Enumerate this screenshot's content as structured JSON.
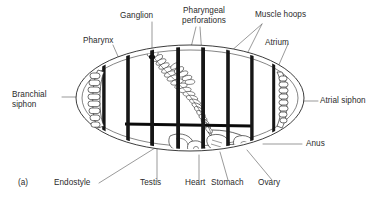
{
  "figure": {
    "panel_mark": "(a)",
    "background_color": "#ffffff",
    "ink_color": "#1a1a1a",
    "leader_color": "#6b6b6b"
  },
  "labels": {
    "pharynx": "Pharynx",
    "ganglion": "Ganglion",
    "pharyngeal_perforations": "Pharyngeal\nperforations",
    "muscle_hoops": "Muscle hoops",
    "atrium": "Atrium",
    "branchial_siphon": "Branchial\nsiphon",
    "atrial_siphon": "Atrial siphon",
    "anus": "Anus",
    "endostyle": "Endostyle",
    "testis": "Testis",
    "heart": "Heart",
    "stomach": "Stomach",
    "ovary": "Ovary"
  },
  "anatomy": {
    "body_outline": {
      "name": "tunic-ellipse",
      "center_x": 190,
      "center_y": 98,
      "radius_x": 114,
      "radius_y": 52,
      "wall_layers": 2
    },
    "muscle_hoops": {
      "count": 8,
      "color": "#111111",
      "x_positions": [
        104,
        128,
        152,
        178,
        203,
        228,
        252,
        274
      ]
    },
    "branchial_siphon": {
      "side": "left",
      "tentacle_count": 8
    },
    "atrial_siphon": {
      "side": "right",
      "tentacle_count": 8
    },
    "endostyle": {
      "orientation": "horizontal",
      "y": 124,
      "x_start": 125,
      "x_end": 252
    },
    "pharyngeal_perforations": {
      "shape": "s-curve-ladder",
      "cell_count": 34
    },
    "viscera": [
      "heart",
      "stomach",
      "ovary",
      "testis",
      "anus"
    ]
  }
}
